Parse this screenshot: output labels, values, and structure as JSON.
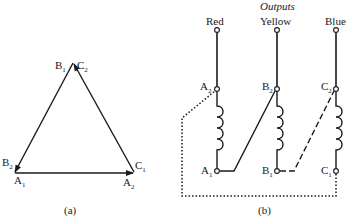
{
  "figure_a": {
    "caption": "(a)",
    "labels": {
      "top_left": {
        "base": "B",
        "sub": "1"
      },
      "top_right": {
        "base": "C",
        "sub": "2"
      },
      "left_upper": {
        "base": "B",
        "sub": "2"
      },
      "left_lower": {
        "base": "A",
        "sub": "1"
      },
      "right_upper": {
        "base": "C",
        "sub": "1"
      },
      "right_lower": {
        "base": "A",
        "sub": "2"
      }
    }
  },
  "figure_b": {
    "caption": "(b)",
    "title": "Outputs",
    "outputs": [
      "Red",
      "Yellow",
      "Blue"
    ],
    "terminals": {
      "a_top": {
        "base": "A",
        "sub": "2"
      },
      "b_top": {
        "base": "B",
        "sub": "2"
      },
      "c_top": {
        "base": "C",
        "sub": "2"
      },
      "a_bottom": {
        "base": "A",
        "sub": "1"
      },
      "b_bottom": {
        "base": "B",
        "sub": "1"
      },
      "c_bottom": {
        "base": "C",
        "sub": "1"
      }
    }
  },
  "colors": {
    "ink": "#1a1a1a",
    "background": "#ffffff"
  }
}
